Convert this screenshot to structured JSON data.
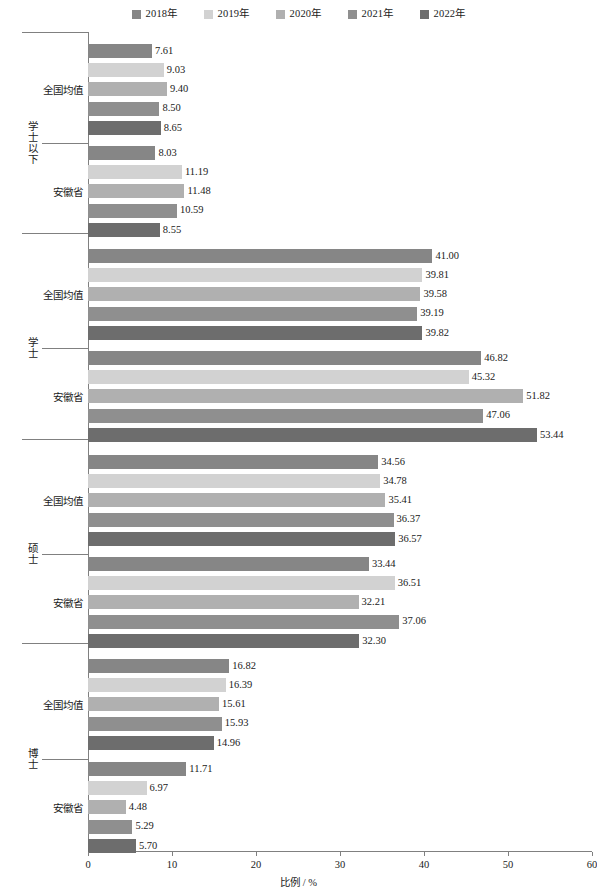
{
  "legend": {
    "position": "top-center",
    "items": [
      {
        "label": "2018年",
        "color": "#868686"
      },
      {
        "label": "2019年",
        "color": "#d2d2d2"
      },
      {
        "label": "2020年",
        "color": "#b0b0b0"
      },
      {
        "label": "2021年",
        "color": "#8f8f8f"
      },
      {
        "label": "2022年",
        "color": "#6d6d6d"
      }
    ]
  },
  "axis": {
    "x_title": "比例 / %",
    "x_ticks": [
      0,
      10,
      20,
      30,
      40,
      50,
      60
    ],
    "x_tick_labels": [
      "0",
      "10",
      "20",
      "30",
      "40",
      "50",
      "60"
    ],
    "x_min": 0,
    "x_max": 60
  },
  "chart_data": {
    "type": "bar",
    "orientation": "horizontal",
    "title": "",
    "subtitle": "",
    "xlabel": "比例 / %",
    "ylabel": "",
    "xlim": [
      0,
      60
    ],
    "grid": false,
    "legend_position": "top-center",
    "series": [
      {
        "name": "2018年",
        "color": "#868686"
      },
      {
        "name": "2019年",
        "color": "#d2d2d2"
      },
      {
        "name": "2020年",
        "color": "#b0b0b0"
      },
      {
        "name": "2021年",
        "color": "#8f8f8f"
      },
      {
        "name": "2022年",
        "color": "#6d6d6d"
      }
    ],
    "outer_categories": [
      "学士以下",
      "学士",
      "硕士",
      "博士"
    ],
    "inner_categories": [
      "全国均值",
      "安徽省"
    ],
    "groups": [
      {
        "outer": "学士以下",
        "rows": [
          {
            "inner": "全国均值",
            "values": [
              7.61,
              9.03,
              9.4,
              8.5,
              8.65
            ],
            "labels": [
              "7.61",
              "9.03",
              "9.40",
              "8.50",
              "8.65"
            ]
          },
          {
            "inner": "安徽省",
            "values": [
              8.03,
              11.19,
              11.48,
              10.59,
              8.55
            ],
            "labels": [
              "8.03",
              "11.19",
              "11.48",
              "10.59",
              "8.55"
            ]
          }
        ]
      },
      {
        "outer": "学士",
        "rows": [
          {
            "inner": "全国均值",
            "values": [
              41.0,
              39.81,
              39.58,
              39.19,
              39.82
            ],
            "labels": [
              "41.00",
              "39.81",
              "39.58",
              "39.19",
              "39.82"
            ]
          },
          {
            "inner": "安徽省",
            "values": [
              46.82,
              45.32,
              51.82,
              47.06,
              53.44
            ],
            "labels": [
              "46.82",
              "45.32",
              "51.82",
              "47.06",
              "53.44"
            ]
          }
        ]
      },
      {
        "outer": "硕士",
        "rows": [
          {
            "inner": "全国均值",
            "values": [
              34.56,
              34.78,
              35.41,
              36.37,
              36.57
            ],
            "labels": [
              "34.56",
              "34.78",
              "35.41",
              "36.37",
              "36.57"
            ]
          },
          {
            "inner": "安徽省",
            "values": [
              33.44,
              36.51,
              32.21,
              37.06,
              32.3
            ],
            "labels": [
              "33.44",
              "36.51",
              "32.21",
              "37.06",
              "32.30"
            ]
          }
        ]
      },
      {
        "outer": "博士",
        "rows": [
          {
            "inner": "全国均值",
            "values": [
              16.82,
              16.39,
              15.61,
              15.93,
              14.96
            ],
            "labels": [
              "16.82",
              "16.39",
              "15.61",
              "15.93",
              "14.96"
            ]
          },
          {
            "inner": "安徽省",
            "values": [
              11.71,
              6.97,
              4.48,
              5.29,
              5.7
            ],
            "labels": [
              "11.71",
              "6.97",
              "4.48",
              "5.29",
              "5.70"
            ]
          }
        ]
      }
    ]
  }
}
